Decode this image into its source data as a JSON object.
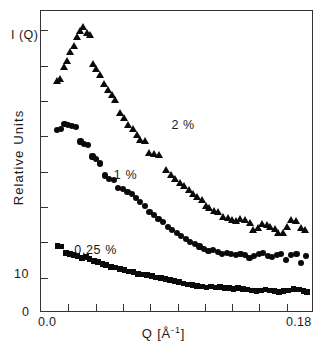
{
  "figure": {
    "iq_label": "I (Q)",
    "ylabel": "Relative Units",
    "xlabel_main": "Q [",
    "xlabel_unit": "Å",
    "xlabel_exp": "-1",
    "xlabel_close": "]",
    "background_color": "#ffffff",
    "marker_color": "#0a0a0a",
    "frame_color": "#333333"
  },
  "axes": {
    "x_tick_labels": [
      "0.0",
      "0.18"
    ],
    "x_tick_label_positions": [
      0.0,
      0.18
    ],
    "x_tick_count": 9,
    "y_tick_labels": [
      "0",
      "10"
    ],
    "y_tick_label_values": [
      0,
      10
    ],
    "y_tick_count": 8
  },
  "annotations": [
    {
      "name": "series-label-2pct",
      "text": "2 %",
      "x": 0.086,
      "y": 62
    },
    {
      "name": "series-label-1pct",
      "text": "1 %",
      "x": 0.048,
      "y": 45.5
    },
    {
      "name": "series-label-025pct",
      "text": "0.25 %",
      "x": 0.022,
      "y": 20.5
    }
  ],
  "chart_data": {
    "type": "scatter",
    "title": "",
    "xlabel": "Q [Å-1]",
    "ylabel": "Relative Units",
    "xlim": [
      0.0,
      0.18
    ],
    "ylim": [
      0,
      100
    ],
    "grid": false,
    "legend": "inline-annotations",
    "series": [
      {
        "name": "2 %",
        "marker": "triangle",
        "color": "#0a0a0a",
        "points": [
          [
            0.0105,
            77.0
          ],
          [
            0.0125,
            77.5
          ],
          [
            0.015,
            81.5
          ],
          [
            0.017,
            83.5
          ],
          [
            0.019,
            86.5
          ],
          [
            0.0215,
            88.5
          ],
          [
            0.0235,
            91.5
          ],
          [
            0.0255,
            93.5
          ],
          [
            0.0275,
            94.8
          ],
          [
            0.03,
            92.8
          ],
          [
            0.032,
            92.2
          ],
          [
            0.0345,
            82.5
          ],
          [
            0.0365,
            81.0
          ],
          [
            0.039,
            79.0
          ],
          [
            0.0415,
            76.0
          ],
          [
            0.044,
            74.0
          ],
          [
            0.0465,
            72.2
          ],
          [
            0.049,
            70.8
          ],
          [
            0.052,
            66.3
          ],
          [
            0.0545,
            64.8
          ],
          [
            0.0575,
            62.5
          ],
          [
            0.0605,
            61.0
          ],
          [
            0.063,
            59.2
          ],
          [
            0.0655,
            57.5
          ],
          [
            0.0685,
            57.2
          ],
          [
            0.0715,
            53.0
          ],
          [
            0.0745,
            52.8
          ],
          [
            0.078,
            52.6
          ],
          [
            0.0825,
            47.5
          ],
          [
            0.0855,
            46.0
          ],
          [
            0.0885,
            44.5
          ],
          [
            0.0915,
            43.2
          ],
          [
            0.0945,
            42.2
          ],
          [
            0.0975,
            41.0
          ],
          [
            0.1005,
            39.5
          ],
          [
            0.103,
            38.5
          ],
          [
            0.106,
            37.5
          ],
          [
            0.1085,
            35.5
          ],
          [
            0.111,
            35.0
          ],
          [
            0.114,
            34.0
          ],
          [
            0.117,
            33.5
          ],
          [
            0.12,
            31.8
          ],
          [
            0.123,
            31.5
          ],
          [
            0.126,
            30.8
          ],
          [
            0.1285,
            30.5
          ],
          [
            0.1315,
            31.2
          ],
          [
            0.1345,
            30.8
          ],
          [
            0.1375,
            30.0
          ],
          [
            0.14,
            27.8
          ],
          [
            0.143,
            28.2
          ],
          [
            0.146,
            29.5
          ],
          [
            0.149,
            29.2
          ],
          [
            0.151,
            28.8
          ],
          [
            0.154,
            28.0
          ],
          [
            0.1565,
            26.8
          ],
          [
            0.1595,
            26.5
          ],
          [
            0.162,
            28.5
          ],
          [
            0.165,
            31.0
          ],
          [
            0.168,
            30.5
          ],
          [
            0.1715,
            28.2
          ],
          [
            0.174,
            27.8
          ]
        ]
      },
      {
        "name": "1 %",
        "marker": "circle",
        "color": "#0a0a0a",
        "points": [
          [
            0.0105,
            60.5
          ],
          [
            0.013,
            61.0
          ],
          [
            0.0155,
            62.5
          ],
          [
            0.018,
            62.3
          ],
          [
            0.0205,
            61.8
          ],
          [
            0.023,
            61.5
          ],
          [
            0.026,
            56.8
          ],
          [
            0.0285,
            56.0
          ],
          [
            0.031,
            55.5
          ],
          [
            0.034,
            51.8
          ],
          [
            0.0365,
            51.0
          ],
          [
            0.039,
            49.5
          ],
          [
            0.042,
            45.5
          ],
          [
            0.045,
            44.5
          ],
          [
            0.048,
            44.0
          ],
          [
            0.051,
            41.5
          ],
          [
            0.054,
            41.0
          ],
          [
            0.057,
            40.2
          ],
          [
            0.06,
            39.5
          ],
          [
            0.0625,
            38.2
          ],
          [
            0.0655,
            36.8
          ],
          [
            0.0685,
            35.5
          ],
          [
            0.0715,
            33.5
          ],
          [
            0.0745,
            32.5
          ],
          [
            0.0775,
            31.0
          ],
          [
            0.0805,
            30.0
          ],
          [
            0.0835,
            28.5
          ],
          [
            0.0865,
            27.5
          ],
          [
            0.0895,
            26.5
          ],
          [
            0.0925,
            25.5
          ],
          [
            0.0955,
            24.5
          ],
          [
            0.0985,
            23.5
          ],
          [
            0.1015,
            22.8
          ],
          [
            0.1045,
            22.0
          ],
          [
            0.1075,
            21.2
          ],
          [
            0.1105,
            20.5
          ],
          [
            0.1135,
            20.8
          ],
          [
            0.1165,
            20.3
          ],
          [
            0.1195,
            19.5
          ],
          [
            0.1225,
            19.8
          ],
          [
            0.1255,
            19.5
          ],
          [
            0.1285,
            19.2
          ],
          [
            0.1315,
            19.5
          ],
          [
            0.1345,
            19.3
          ],
          [
            0.1375,
            18.2
          ],
          [
            0.1405,
            19.0
          ],
          [
            0.1435,
            19.5
          ],
          [
            0.1465,
            19.8
          ],
          [
            0.1495,
            19.0
          ],
          [
            0.1525,
            18.5
          ],
          [
            0.1555,
            19.2
          ],
          [
            0.1585,
            19.5
          ],
          [
            0.1615,
            17.5
          ],
          [
            0.165,
            19.2
          ],
          [
            0.1685,
            19.5
          ],
          [
            0.1715,
            16.5
          ],
          [
            0.1745,
            18.8
          ]
        ]
      },
      {
        "name": "0.25 %",
        "marker": "square",
        "color": "#0a0a0a",
        "points": [
          [
            0.011,
            22.2
          ],
          [
            0.0135,
            22.0
          ],
          [
            0.0165,
            19.8
          ],
          [
            0.019,
            19.5
          ],
          [
            0.0215,
            19.2
          ],
          [
            0.024,
            18.8
          ],
          [
            0.027,
            18.2
          ],
          [
            0.0295,
            18.5
          ],
          [
            0.032,
            17.8
          ],
          [
            0.035,
            17.2
          ],
          [
            0.0375,
            16.8
          ],
          [
            0.0405,
            16.2
          ],
          [
            0.043,
            15.8
          ],
          [
            0.046,
            15.2
          ],
          [
            0.049,
            15.0
          ],
          [
            0.052,
            14.5
          ],
          [
            0.055,
            14.2
          ],
          [
            0.058,
            13.8
          ],
          [
            0.061,
            13.5
          ],
          [
            0.064,
            13.0
          ],
          [
            0.067,
            12.8
          ],
          [
            0.07,
            12.5
          ],
          [
            0.073,
            12.2
          ],
          [
            0.076,
            11.8
          ],
          [
            0.079,
            11.5
          ],
          [
            0.082,
            11.2
          ],
          [
            0.085,
            11.0
          ],
          [
            0.088,
            10.5
          ],
          [
            0.091,
            10.2
          ],
          [
            0.094,
            9.8
          ],
          [
            0.097,
            9.5
          ],
          [
            0.1,
            9.2
          ],
          [
            0.103,
            9.0
          ],
          [
            0.106,
            8.8
          ],
          [
            0.109,
            8.5
          ],
          [
            0.112,
            8.8
          ],
          [
            0.115,
            8.5
          ],
          [
            0.118,
            8.6
          ],
          [
            0.121,
            8.3
          ],
          [
            0.124,
            8.2
          ],
          [
            0.127,
            8.0
          ],
          [
            0.13,
            8.2
          ],
          [
            0.133,
            8.0
          ],
          [
            0.136,
            7.8
          ],
          [
            0.139,
            7.5
          ],
          [
            0.142,
            7.2
          ],
          [
            0.145,
            7.5
          ],
          [
            0.148,
            7.8
          ],
          [
            0.151,
            7.5
          ],
          [
            0.154,
            7.2
          ],
          [
            0.157,
            7.0
          ],
          [
            0.16,
            7.2
          ],
          [
            0.163,
            7.5
          ],
          [
            0.1665,
            8.0
          ],
          [
            0.17,
            7.8
          ],
          [
            0.173,
            7.2
          ],
          [
            0.1755,
            7.0
          ]
        ]
      }
    ]
  }
}
